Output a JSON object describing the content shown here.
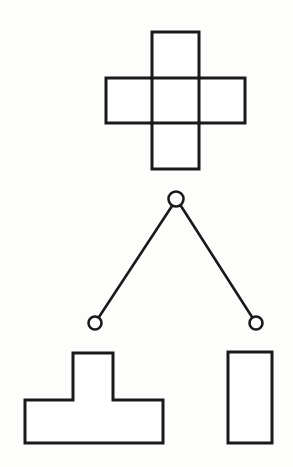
{
  "figure": {
    "title": "Cube net and decision-tree figure",
    "background_color": "#fdfdfc",
    "stroke_color": "#1a1a1a",
    "fill_color": "#ffffff",
    "width": 293,
    "height": 467
  },
  "shapes": {
    "cube_net": {
      "label": "cube-net-cross",
      "stroke_width": 3,
      "description": "Plus/cross shaped polygon made of five squares",
      "points": "152,32 199,32 199,78 245,78 245,123 199,123 199,169 152,169 152,123 106,123 106,78 152,78",
      "inner_lines": [
        {
          "label": "vertical-left-divider",
          "x1": 152,
          "y1": 78,
          "x2": 152,
          "y2": 123
        },
        {
          "label": "vertical-right-divider",
          "x1": 199,
          "y1": 78,
          "x2": 199,
          "y2": 123
        },
        {
          "label": "horizontal-top-divider",
          "x1": 152,
          "y1": 78,
          "x2": 199,
          "y2": 78
        },
        {
          "label": "horizontal-bottom-divider",
          "x1": 152,
          "y1": 123,
          "x2": 199,
          "y2": 123
        }
      ]
    },
    "tee_shape": {
      "label": "tee-polygon",
      "stroke_width": 3,
      "points": "73,353 113,353 113,400 163,400 163,443 25,443 25,400 73,400"
    },
    "rectangle_shape": {
      "label": "tall-rectangle",
      "stroke_width": 3,
      "x": 228,
      "y": 352,
      "width": 44,
      "height": 91
    }
  },
  "tree": {
    "label": "decision-tree",
    "stroke_width": 2.6,
    "node_radius_root": 7.5,
    "node_radius_leaf": 6.5,
    "nodes": [
      {
        "id": "root",
        "label": "root-node",
        "cx": 176,
        "cy": 199
      },
      {
        "id": "left-leaf",
        "label": "left-leaf-node",
        "cx": 95,
        "cy": 323
      },
      {
        "id": "right-leaf",
        "label": "right-leaf-node",
        "cx": 256,
        "cy": 323
      }
    ],
    "edges": [
      {
        "id": "root-to-left",
        "label": "edge-root-left",
        "x1": 172,
        "y1": 206,
        "x2": 99,
        "y2": 317
      },
      {
        "id": "root-to-right",
        "label": "edge-root-right",
        "x1": 181,
        "y1": 206,
        "x2": 252,
        "y2": 317
      }
    ]
  }
}
